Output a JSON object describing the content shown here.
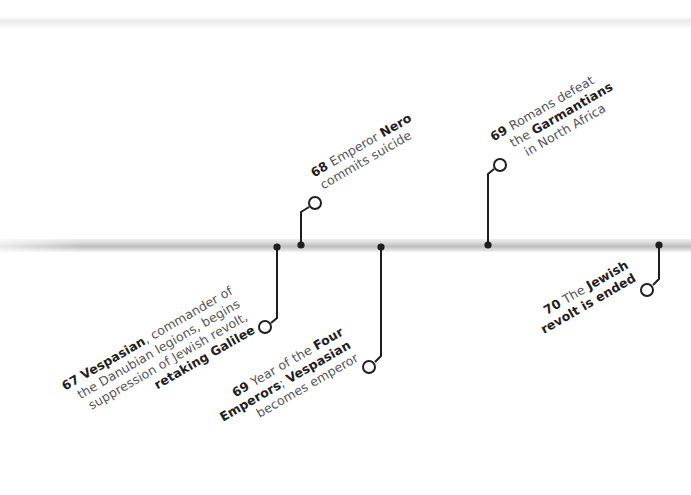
{
  "colors": {
    "line": "#1e1e1e",
    "text": "#555555",
    "bold_text": "#1e1e1e",
    "bar": "#c8c8c8"
  },
  "events": [
    {
      "year": "67",
      "lines": [
        [
          "",
          "Vespasian",
          ", commander of"
        ],
        [
          "the Danubian legions, begins",
          "",
          ""
        ],
        [
          "suppression of Jewish revolt,",
          "",
          ""
        ],
        [
          "",
          "retaking Galilee",
          ""
        ]
      ],
      "position": "below"
    },
    {
      "year": "68",
      "lines": [
        [
          "Emperor ",
          "Nero",
          ""
        ],
        [
          "commits suicide",
          "",
          ""
        ]
      ],
      "position": "above"
    },
    {
      "year": "69",
      "lines": [
        [
          "Year of the ",
          "Four",
          ""
        ],
        [
          "",
          "Emperors",
          "; "
        ],
        [
          "",
          "Vespasian",
          ""
        ],
        [
          "becomes emperor",
          "",
          ""
        ]
      ],
      "position": "below"
    },
    {
      "year": "69",
      "lines": [
        [
          "Romans defeat",
          "",
          ""
        ],
        [
          "the ",
          "Garmantians",
          ""
        ],
        [
          "in North Africa",
          "",
          ""
        ]
      ],
      "position": "above"
    },
    {
      "year": "70",
      "lines": [
        [
          "The ",
          "Jewish",
          ""
        ],
        [
          "",
          "revolt is ended",
          ""
        ]
      ],
      "position": "below"
    }
  ],
  "text": {
    "e67": {
      "year": "67",
      "l1b": "Vespasian",
      "l1": ", commander of",
      "l2": "the Danubian legions, begins",
      "l3": "suppression of Jewish revolt,",
      "l4b": "retaking Galilee"
    },
    "e68": {
      "year": "68",
      "l1": " Emperor ",
      "l1b": "Nero",
      "l2": "commits suicide"
    },
    "e69a": {
      "year": "69",
      "l1": " Year of the ",
      "l1b": "Four",
      "l2b": "Emperors",
      "l2": "; ",
      "l2b2": "Vespasian",
      "l3": "becomes emperor"
    },
    "e69b": {
      "year": "69",
      "l1": " Romans defeat",
      "l2": "the ",
      "l2b": "Garmantians",
      "l3": "in North Africa"
    },
    "e70": {
      "year": "70",
      "l1": " The ",
      "l1b": "Jewish",
      "l2b": "revolt is ended"
    }
  }
}
